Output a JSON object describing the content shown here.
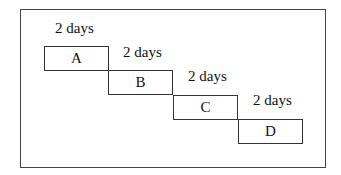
{
  "diagram": {
    "type": "sequential task schedule (staircase)",
    "tasks": [
      {
        "label": "A",
        "duration": "2 days"
      },
      {
        "label": "B",
        "duration": "2 days"
      },
      {
        "label": "C",
        "duration": "2 days"
      },
      {
        "label": "D",
        "duration": "2 days"
      }
    ]
  }
}
